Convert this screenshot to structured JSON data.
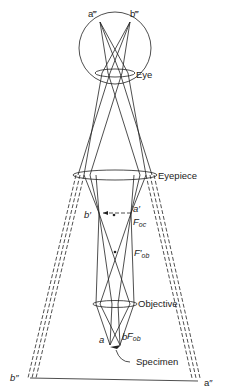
{
  "diagram": {
    "labels": {
      "a_triple": "a‴",
      "b_triple": "b‴",
      "eye": "Eye",
      "eyepiece": "Eyepiece",
      "b_prime": "b′",
      "a_prime": "a′",
      "f_oc": "F",
      "f_oc_sub": "oc",
      "f_ob_prime": "F′",
      "f_ob_prime_sub": "ob",
      "objective": "Objective",
      "a": "a",
      "b": "b",
      "f_ob": "F",
      "f_ob_sub": "ob",
      "specimen": "Specimen",
      "b_double": "b″",
      "a_double": "a″"
    }
  }
}
